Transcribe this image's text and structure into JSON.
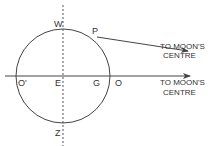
{
  "diagram": {
    "type": "tidal-geometry",
    "colors": {
      "stroke": "#444444",
      "text": "#333333",
      "background": "#ffffff"
    },
    "points": {
      "W": "W",
      "P": "P",
      "O_prime": "O'",
      "E": "E",
      "G": "G",
      "O": "O",
      "Z": "Z"
    },
    "annotations": {
      "upper_arrow": {
        "line1": "TO MOON'S",
        "line2": "CENTRE"
      },
      "lower_arrow": {
        "line1": "TO MOON'S",
        "line2": "CENTRE"
      }
    }
  }
}
